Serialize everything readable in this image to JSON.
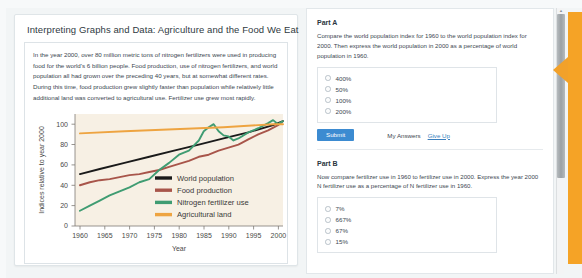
{
  "lesson": {
    "title": "Interpreting Graphs and Data: Agriculture and the Food We Eat",
    "intro_paragraph": "In the year 2000, over 80 million metric tons of nitrogen fertilizers were used in producing food for the world's 6 billion people. Food production, use of nitrogen fertilizers, and world population all had grown over the preceding 40 years, but at somewhat different rates. During this time, food production grew slightly faster than population while relatively little additional land was converted to agricultural use. Fertilizer use grew most rapidly."
  },
  "chart_data": {
    "type": "line",
    "title": "",
    "xlabel": "Year",
    "ylabel": "Indices relative to year 2000",
    "xlim": [
      1960,
      2002
    ],
    "ylim": [
      0,
      110
    ],
    "xticks": [
      1960,
      1965,
      1970,
      1975,
      1980,
      1985,
      1990,
      1995,
      2000
    ],
    "yticks": [
      0,
      20,
      40,
      60,
      80,
      100
    ],
    "grid": false,
    "legend_position": "center",
    "plot_background": "#f7f0e4",
    "series": [
      {
        "name": "World population",
        "color": "#1a1a1a",
        "x": [
          1961,
          1965,
          1970,
          1975,
          1980,
          1985,
          1990,
          1995,
          2000,
          2002
        ],
        "values": [
          51,
          56,
          62,
          68,
          74,
          80,
          86,
          92,
          99,
          103
        ]
      },
      {
        "name": "Food production",
        "color": "#a8554a",
        "x": [
          1961,
          1963,
          1965,
          1967,
          1969,
          1971,
          1973,
          1975,
          1977,
          1979,
          1981,
          1983,
          1985,
          1987,
          1989,
          1991,
          1993,
          1995,
          1997,
          1999,
          2001,
          2002
        ],
        "values": [
          40,
          43,
          45,
          46,
          48,
          50,
          51,
          53,
          55,
          58,
          61,
          64,
          68,
          70,
          74,
          77,
          80,
          85,
          90,
          94,
          99,
          103
        ]
      },
      {
        "name": "Nitrogen fertilizer use",
        "color": "#3f9c72",
        "x": [
          1961,
          1963,
          1965,
          1967,
          1969,
          1971,
          1973,
          1975,
          1977,
          1979,
          1981,
          1983,
          1985,
          1986,
          1987,
          1988,
          1989,
          1990,
          1991,
          1992,
          1993,
          1995,
          1997,
          1999,
          2000,
          2001,
          2002
        ],
        "values": [
          15,
          20,
          25,
          30,
          34,
          38,
          43,
          46,
          55,
          62,
          70,
          74,
          84,
          93,
          97,
          100,
          93,
          89,
          88,
          84,
          86,
          92,
          96,
          101,
          104,
          100,
          103
        ]
      },
      {
        "name": "Agricultural land",
        "color": "#eea441",
        "x": [
          1961,
          1970,
          1980,
          1990,
          2000,
          2002
        ],
        "values": [
          91,
          93,
          95,
          97,
          100,
          100
        ]
      }
    ]
  },
  "questions": [
    {
      "heading": "Part A",
      "prompt": "Compare the world population index for 1960 to the world population index for 2000. Then express the world population in 2000 as a percentage of world population in 1960.",
      "options": [
        "400%",
        "50%",
        "100%",
        "200%"
      ],
      "submit_label": "Submit",
      "my_answers_label": "My Answers",
      "give_up_label": "Give Up"
    },
    {
      "heading": "Part B",
      "prompt": "Now compare fertilizer use in 1960 to fertilizer use in 2000. Express the year 2000 N fertilizer use as a percentage of N fertilizer use in 1960.",
      "options": [
        "7%",
        "667%",
        "67%",
        "15%"
      ]
    }
  ],
  "scrollbar": {
    "up_arrow": "▲"
  },
  "colors": {
    "accent_blue": "#3c8bd1",
    "marker_orange": "#f5a326",
    "plot_bg": "#f7f0e4"
  }
}
